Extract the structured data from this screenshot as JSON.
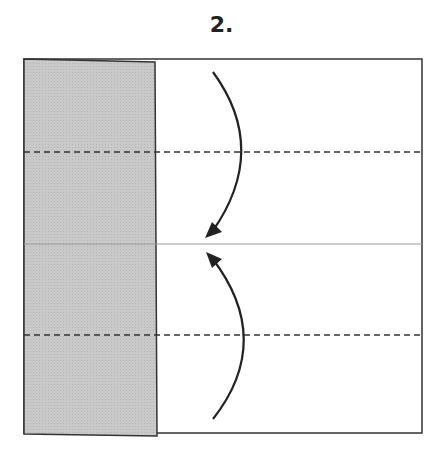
{
  "diagram": {
    "step_label": "2.",
    "paper": {
      "x": 24,
      "y": 59,
      "width": 398,
      "height": 374,
      "border_color": "#333333"
    },
    "folded_flap": {
      "x": 24,
      "y": 59,
      "width": 131,
      "height": 376,
      "fill": "#c8c8c8"
    },
    "center_crease": {
      "y": 244,
      "color": "#999999"
    },
    "valley_fold_lines": [
      {
        "y": 152
      },
      {
        "y": 335
      }
    ],
    "arrows": [
      {
        "name": "fold-top-down-arrow",
        "direction": "down"
      },
      {
        "name": "fold-bottom-up-arrow",
        "direction": "up"
      }
    ]
  }
}
